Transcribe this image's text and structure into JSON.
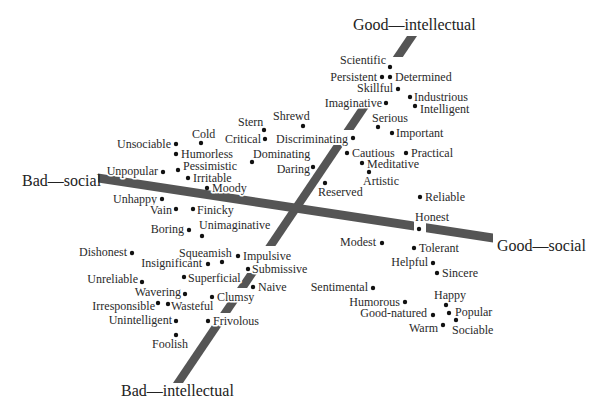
{
  "chart_data": {
    "type": "scatter",
    "title": "",
    "xlabel": "",
    "ylabel": "",
    "grid": false,
    "legend": null,
    "axes": {
      "intellectual": {
        "positive": "Good—intellectual",
        "negative": "Bad—intellectual"
      },
      "social": {
        "positive": "Good—social",
        "negative": "Bad—social"
      }
    },
    "points": [
      {
        "label": "Scientific",
        "x": 390,
        "y": 67,
        "lx": 386,
        "ly": 64,
        "anchor": "end"
      },
      {
        "label": "Persistent",
        "x": 382,
        "y": 77,
        "lx": 377,
        "ly": 81,
        "anchor": "end"
      },
      {
        "label": "Determined",
        "x": 390,
        "y": 77,
        "lx": 395,
        "ly": 81,
        "anchor": "start"
      },
      {
        "label": "Skillful",
        "x": 398,
        "y": 89,
        "lx": 393,
        "ly": 92,
        "anchor": "end"
      },
      {
        "label": "Industrious",
        "x": 410,
        "y": 97,
        "lx": 414,
        "ly": 101,
        "anchor": "start"
      },
      {
        "label": "Intelligent",
        "x": 415,
        "y": 106,
        "lx": 420,
        "ly": 113,
        "anchor": "start"
      },
      {
        "label": "Imaginative",
        "x": 386,
        "y": 103,
        "lx": 382,
        "ly": 107,
        "anchor": "end"
      },
      {
        "label": "Serious",
        "x": 378,
        "y": 127,
        "lx": 372,
        "ly": 122,
        "anchor": "start"
      },
      {
        "label": "Important",
        "x": 392,
        "y": 133,
        "lx": 396,
        "ly": 137,
        "anchor": "start"
      },
      {
        "label": "Discriminating",
        "x": 353,
        "y": 138,
        "lx": 348,
        "ly": 143,
        "anchor": "end"
      },
      {
        "label": "Cautious",
        "x": 347,
        "y": 153,
        "lx": 352,
        "ly": 157,
        "anchor": "start"
      },
      {
        "label": "Practical",
        "x": 406,
        "y": 153,
        "lx": 411,
        "ly": 157,
        "anchor": "start"
      },
      {
        "label": "Meditative",
        "x": 362,
        "y": 163,
        "lx": 367,
        "ly": 168,
        "anchor": "start"
      },
      {
        "label": "Artistic",
        "x": 369,
        "y": 172,
        "lx": 363,
        "ly": 185,
        "anchor": "start"
      },
      {
        "label": "Reserved",
        "x": 325,
        "y": 183,
        "lx": 318,
        "ly": 196,
        "anchor": "start"
      },
      {
        "label": "Stern",
        "x": 264,
        "y": 130,
        "lx": 238,
        "ly": 126,
        "anchor": "start"
      },
      {
        "label": "Shrewd",
        "x": 303,
        "y": 126,
        "lx": 273,
        "ly": 120,
        "anchor": "start"
      },
      {
        "label": "Critical",
        "x": 265,
        "y": 139,
        "lx": 261,
        "ly": 143,
        "anchor": "end"
      },
      {
        "label": "Dominating",
        "x": 252,
        "y": 162,
        "lx": 253,
        "ly": 158,
        "anchor": "start"
      },
      {
        "label": "Daring",
        "x": 313,
        "y": 167,
        "lx": 310,
        "ly": 173,
        "anchor": "end"
      },
      {
        "label": "Cold",
        "x": 201,
        "y": 143,
        "lx": 192,
        "ly": 138,
        "anchor": "start"
      },
      {
        "label": "Unsociable",
        "x": 176,
        "y": 144,
        "lx": 171,
        "ly": 148,
        "anchor": "end"
      },
      {
        "label": "Humorless",
        "x": 176,
        "y": 154,
        "lx": 181,
        "ly": 158,
        "anchor": "start"
      },
      {
        "label": "Pessimistic",
        "x": 178,
        "y": 170,
        "lx": 183,
        "ly": 170,
        "anchor": "start"
      },
      {
        "label": "Unpopular",
        "x": 163,
        "y": 172,
        "lx": 158,
        "ly": 175,
        "anchor": "end"
      },
      {
        "label": "Irritable",
        "x": 188,
        "y": 178,
        "lx": 193,
        "ly": 182,
        "anchor": "start"
      },
      {
        "label": "Moody",
        "x": 207,
        "y": 188,
        "lx": 212,
        "ly": 192,
        "anchor": "start"
      },
      {
        "label": "Unhappy",
        "x": 162,
        "y": 199,
        "lx": 157,
        "ly": 203,
        "anchor": "end"
      },
      {
        "label": "Vain",
        "x": 176,
        "y": 209,
        "lx": 172,
        "ly": 214,
        "anchor": "end"
      },
      {
        "label": "Finicky",
        "x": 193,
        "y": 209,
        "lx": 197,
        "ly": 214,
        "anchor": "start"
      },
      {
        "label": "Boring",
        "x": 189,
        "y": 230,
        "lx": 184,
        "ly": 233,
        "anchor": "end"
      },
      {
        "label": "Unimaginative",
        "x": 202,
        "y": 236,
        "lx": 199,
        "ly": 229,
        "anchor": "start"
      },
      {
        "label": "Dishonest",
        "x": 132,
        "y": 253,
        "lx": 127,
        "ly": 256,
        "anchor": "end"
      },
      {
        "label": "Squeamish",
        "x": 222,
        "y": 262,
        "lx": 179,
        "ly": 257,
        "anchor": "start"
      },
      {
        "label": "Impulsive",
        "x": 238,
        "y": 256,
        "lx": 243,
        "ly": 260,
        "anchor": "start"
      },
      {
        "label": "Insignificant",
        "x": 208,
        "y": 264,
        "lx": 202,
        "ly": 267,
        "anchor": "end"
      },
      {
        "label": "Submissive",
        "x": 248,
        "y": 269,
        "lx": 252,
        "ly": 273,
        "anchor": "start"
      },
      {
        "label": "Unreliable",
        "x": 142,
        "y": 282,
        "lx": 138,
        "ly": 283,
        "anchor": "end"
      },
      {
        "label": "Superficial",
        "x": 184,
        "y": 277,
        "lx": 188,
        "ly": 282,
        "anchor": "start"
      },
      {
        "label": "Naive",
        "x": 253,
        "y": 287,
        "lx": 258,
        "ly": 291,
        "anchor": "start"
      },
      {
        "label": "Wavering",
        "x": 185,
        "y": 294,
        "lx": 181,
        "ly": 296,
        "anchor": "end"
      },
      {
        "label": "Clumsy",
        "x": 212,
        "y": 297,
        "lx": 217,
        "ly": 301,
        "anchor": "start"
      },
      {
        "label": "Irresponsible",
        "x": 158,
        "y": 303,
        "lx": 155,
        "ly": 310,
        "anchor": "end"
      },
      {
        "label": "Wasteful",
        "x": 168,
        "y": 304,
        "lx": 171,
        "ly": 310,
        "anchor": "start"
      },
      {
        "label": "Unintelligent",
        "x": 176,
        "y": 321,
        "lx": 172,
        "ly": 324,
        "anchor": "end"
      },
      {
        "label": "Frivolous",
        "x": 208,
        "y": 321,
        "lx": 213,
        "ly": 325,
        "anchor": "start"
      },
      {
        "label": "Foolish",
        "x": 176,
        "y": 335,
        "lx": 152,
        "ly": 348,
        "anchor": "start"
      },
      {
        "label": "Reliable",
        "x": 420,
        "y": 197,
        "lx": 425,
        "ly": 201,
        "anchor": "start"
      },
      {
        "label": "Honest",
        "x": 419,
        "y": 229,
        "lx": 415,
        "ly": 221,
        "anchor": "start"
      },
      {
        "label": "Modest",
        "x": 382,
        "y": 243,
        "lx": 376,
        "ly": 246,
        "anchor": "end"
      },
      {
        "label": "Tolerant",
        "x": 414,
        "y": 248,
        "lx": 419,
        "ly": 252,
        "anchor": "start"
      },
      {
        "label": "Helpful",
        "x": 433,
        "y": 263,
        "lx": 428,
        "ly": 266,
        "anchor": "end"
      },
      {
        "label": "Sincere",
        "x": 437,
        "y": 273,
        "lx": 442,
        "ly": 277,
        "anchor": "start"
      },
      {
        "label": "Sentimental",
        "x": 373,
        "y": 288,
        "lx": 368,
        "ly": 291,
        "anchor": "end"
      },
      {
        "label": "Humorous",
        "x": 405,
        "y": 302,
        "lx": 400,
        "ly": 306,
        "anchor": "end"
      },
      {
        "label": "Happy",
        "x": 446,
        "y": 305,
        "lx": 434,
        "ly": 299,
        "anchor": "start"
      },
      {
        "label": "Good-natured",
        "x": 433,
        "y": 315,
        "lx": 427,
        "ly": 317,
        "anchor": "end"
      },
      {
        "label": "Popular",
        "x": 449,
        "y": 313,
        "lx": 455,
        "ly": 316,
        "anchor": "start"
      },
      {
        "label": "Warm",
        "x": 443,
        "y": 325,
        "lx": 438,
        "ly": 332,
        "anchor": "end"
      },
      {
        "label": "Sociable",
        "x": 456,
        "y": 320,
        "lx": 452,
        "ly": 334,
        "anchor": "start"
      }
    ]
  },
  "colors": {
    "axis": "#555555",
    "text": "#2a2a2a",
    "dot": "#111111",
    "background": "#ffffff"
  }
}
